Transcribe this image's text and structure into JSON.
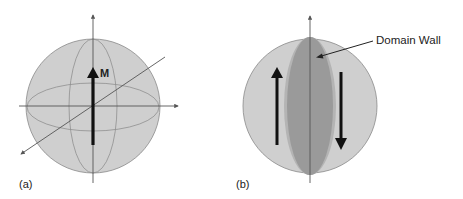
{
  "figure": {
    "panel_a": {
      "label": "(a)",
      "vector_label": "M",
      "sphere_fill": "#cfcfcf",
      "stroke": "#666666"
    },
    "panel_b": {
      "label": "(b)",
      "annotation": "Domain Wall",
      "sphere_fill": "#cfcfcf",
      "wall_fill": "#9a9a9a",
      "wall_edge": "#b4b4b4"
    }
  }
}
